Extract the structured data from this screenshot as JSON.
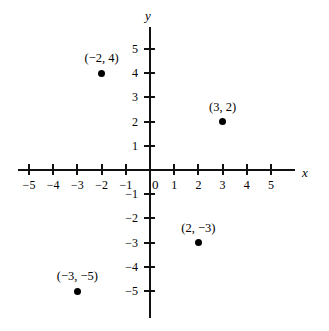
{
  "chart_data": {
    "type": "scatter",
    "title": "",
    "xlabel": "x",
    "ylabel": "y",
    "xlim": [
      -5.8,
      5.8
    ],
    "ylim": [
      -6.0,
      6.0
    ],
    "grid": false,
    "legend": false,
    "origin_label": "0",
    "x_ticks": [
      {
        "value": -5,
        "label": "−5"
      },
      {
        "value": -4,
        "label": "−4"
      },
      {
        "value": -3,
        "label": "−3"
      },
      {
        "value": -2,
        "label": "−2"
      },
      {
        "value": -1,
        "label": "−1"
      },
      {
        "value": 1,
        "label": "1"
      },
      {
        "value": 2,
        "label": "2"
      },
      {
        "value": 3,
        "label": "3"
      },
      {
        "value": 4,
        "label": "4"
      },
      {
        "value": 5,
        "label": "5"
      }
    ],
    "y_ticks": [
      {
        "value": 5,
        "label": "5"
      },
      {
        "value": 4,
        "label": "4"
      },
      {
        "value": 3,
        "label": "3"
      },
      {
        "value": 2,
        "label": "2"
      },
      {
        "value": 1,
        "label": "1"
      },
      {
        "value": -1,
        "label": "−1"
      },
      {
        "value": -2,
        "label": "−2"
      },
      {
        "value": -3,
        "label": "−3"
      },
      {
        "value": -4,
        "label": "−4"
      },
      {
        "value": -5,
        "label": "−5"
      }
    ],
    "points": [
      {
        "x": -2,
        "y": 4,
        "label": "(−2, 4)",
        "label_position": "above"
      },
      {
        "x": 3,
        "y": 2,
        "label": "(3, 2)",
        "label_position": "above"
      },
      {
        "x": 2,
        "y": -3,
        "label": "(2, −3)",
        "label_position": "above"
      },
      {
        "x": -3,
        "y": -5,
        "label": "(−3, −5)",
        "label_position": "above"
      }
    ]
  }
}
